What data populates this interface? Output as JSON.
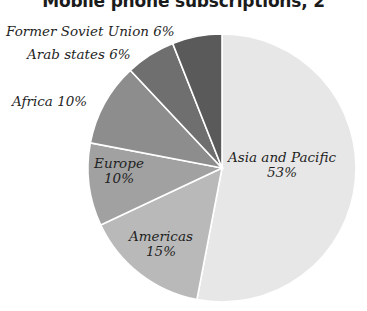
{
  "title": "Mobile phone subscriptions, 2",
  "chart_data": {
    "type": "pie",
    "title": "Mobile phone subscriptions, 2",
    "xlabel": "",
    "ylabel": "",
    "legend_position": "none",
    "grid": false,
    "unit": "%",
    "start_angle_deg": 0,
    "direction": "clockwise",
    "center": {
      "x": 222,
      "y": 168
    },
    "radius": 134,
    "categories": [
      "Asia and Pacific",
      "Americas",
      "Europe",
      "Africa",
      "Arab states",
      "Former Soviet Union"
    ],
    "values": [
      53,
      15,
      10,
      10,
      6,
      6
    ],
    "labels": [
      "Asia and Pacific 53%",
      "Americas 15%",
      "Europe 10%",
      "Africa 10%",
      "Arab states 6%",
      "Former Soviet Union 6%"
    ],
    "colors": [
      "#e7e7e7",
      "#b9b9b9",
      "#a1a1a1",
      "#8d8d8d",
      "#6f6f6f",
      "#5a5a5a"
    ],
    "slices": [
      {
        "name": "Asia and Pacific",
        "value": 53,
        "value_text": "53%",
        "color": "#e7e7e7",
        "label_placement": "inside",
        "start_deg": 0,
        "end_deg": 190.8
      },
      {
        "name": "Americas",
        "value": 15,
        "value_text": "15%",
        "color": "#b9b9b9",
        "label_placement": "inside",
        "start_deg": 190.8,
        "end_deg": 244.8
      },
      {
        "name": "Europe",
        "value": 10,
        "value_text": "10%",
        "color": "#a1a1a1",
        "label_placement": "inside",
        "start_deg": 244.8,
        "end_deg": 280.8
      },
      {
        "name": "Africa",
        "value": 10,
        "value_text": "10%",
        "color": "#8d8d8d",
        "label_placement": "outside",
        "start_deg": 280.8,
        "end_deg": 316.8
      },
      {
        "name": "Arab states",
        "value": 6,
        "value_text": "6%",
        "color": "#6f6f6f",
        "label_placement": "outside",
        "start_deg": 316.8,
        "end_deg": 338.4
      },
      {
        "name": "Former Soviet Union",
        "value": 6,
        "value_text": "6%",
        "color": "#5a5a5a",
        "label_placement": "outside",
        "start_deg": 338.4,
        "end_deg": 360
      }
    ]
  },
  "labels": {
    "former_soviet_union": {
      "name": "Former Soviet Union",
      "value": "6%"
    },
    "arab_states": {
      "name": "Arab states",
      "value": "6%"
    },
    "africa": {
      "name": "Africa",
      "value": "10%"
    },
    "europe": {
      "name": "Europe",
      "value": "10%"
    },
    "americas": {
      "name": "Americas",
      "value": "15%"
    },
    "asia_and_pacific": {
      "name": "Asia and Pacific",
      "value": "53%"
    }
  }
}
